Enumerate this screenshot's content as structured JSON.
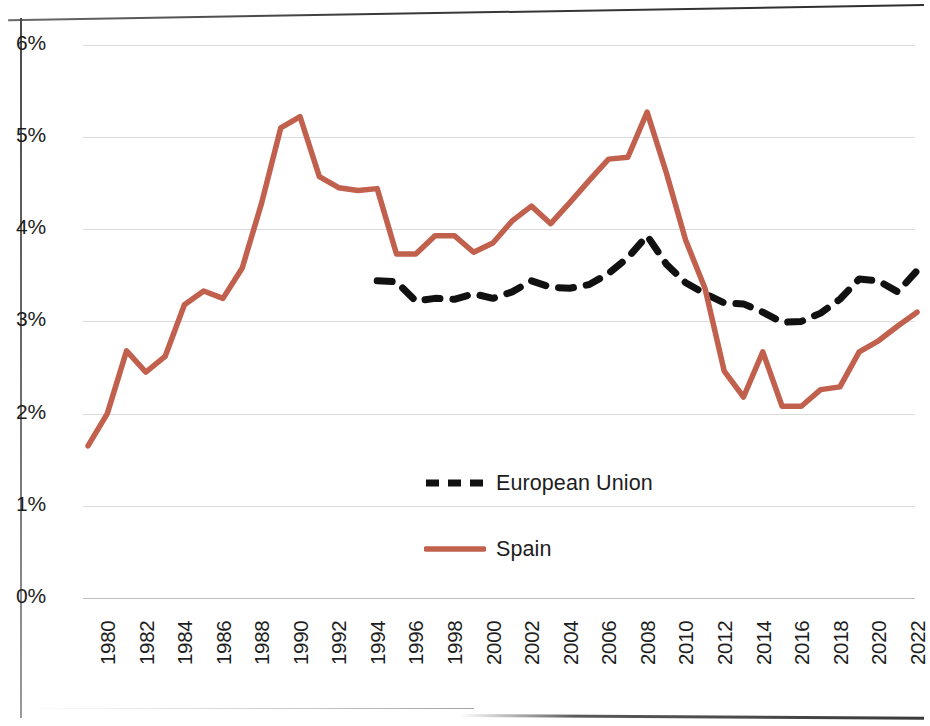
{
  "chart_data": {
    "type": "line",
    "title": "",
    "subtitle": "",
    "xlabel": "",
    "ylabel": "",
    "xlim": [
      1980,
      2023
    ],
    "ylim": [
      0,
      6
    ],
    "y_ticks": [
      0,
      1,
      2,
      3,
      4,
      5,
      6
    ],
    "y_tick_labels": [
      "0%",
      "1%",
      "2%",
      "3%",
      "4%",
      "5%",
      "6%"
    ],
    "x_tick_labels": [
      "1980",
      "1982",
      "1984",
      "1986",
      "1988",
      "1990",
      "1992",
      "1994",
      "1996",
      "1998",
      "2000",
      "2002",
      "2004",
      "2006",
      "2008",
      "2010",
      "2012",
      "2014",
      "2016",
      "2018",
      "2020",
      "2022"
    ],
    "x_tick_values": [
      1980,
      1982,
      1984,
      1986,
      1988,
      1990,
      1992,
      1994,
      1996,
      1998,
      2000,
      2002,
      2004,
      2006,
      2008,
      2010,
      2012,
      2014,
      2016,
      2018,
      2020,
      2022
    ],
    "grid": "horizontal",
    "legend_position": "center",
    "series": [
      {
        "name": "European Union",
        "color": "#111111",
        "style": "dashed",
        "x": [
          1995,
          1996,
          1997,
          1998,
          1999,
          2000,
          2001,
          2002,
          2003,
          2004,
          2005,
          2006,
          2007,
          2008,
          2009,
          2010,
          2011,
          2012,
          2013,
          2014,
          2015,
          2016,
          2017,
          2018,
          2019,
          2020,
          2021,
          2022,
          2023
        ],
        "values": [
          3.44,
          3.43,
          3.22,
          3.25,
          3.24,
          3.3,
          3.25,
          3.32,
          3.44,
          3.37,
          3.36,
          3.4,
          3.52,
          3.69,
          3.93,
          3.62,
          3.42,
          3.3,
          3.2,
          3.19,
          3.1,
          2.99,
          3.0,
          3.09,
          3.24,
          3.46,
          3.44,
          3.32,
          3.55
        ]
      },
      {
        "name": "Spain",
        "color": "#c0604d",
        "style": "solid",
        "x": [
          1980,
          1981,
          1982,
          1983,
          1984,
          1985,
          1986,
          1987,
          1988,
          1989,
          1990,
          1991,
          1992,
          1993,
          1994,
          1995,
          1996,
          1997,
          1998,
          1999,
          2000,
          2001,
          2002,
          2003,
          2004,
          2005,
          2006,
          2007,
          2008,
          2009,
          2010,
          2011,
          2012,
          2013,
          2014,
          2015,
          2016,
          2017,
          2018,
          2019,
          2020,
          2021,
          2022,
          2023
        ],
        "values": [
          1.65,
          2.0,
          2.68,
          2.45,
          2.62,
          3.18,
          3.33,
          3.25,
          3.58,
          4.28,
          5.1,
          5.22,
          4.57,
          4.45,
          4.42,
          4.44,
          3.73,
          3.73,
          3.93,
          3.93,
          3.75,
          3.85,
          4.09,
          4.25,
          4.06,
          4.29,
          4.53,
          4.76,
          4.78,
          5.27,
          4.61,
          3.88,
          3.36,
          2.46,
          2.18,
          2.67,
          2.08,
          2.08,
          2.26,
          2.29,
          2.67,
          2.79,
          2.95,
          3.1
        ]
      }
    ]
  },
  "axis": {
    "y_labels": [
      "6%",
      "5%",
      "4%",
      "3%",
      "2%",
      "1%",
      "0%"
    ],
    "x_labels": [
      "1980",
      "1982",
      "1984",
      "1986",
      "1988",
      "1990",
      "1992",
      "1994",
      "1996",
      "1998",
      "2000",
      "2002",
      "2004",
      "2006",
      "2008",
      "2010",
      "2012",
      "2014",
      "2016",
      "2018",
      "2020",
      "2022"
    ]
  },
  "legend": {
    "items": [
      {
        "label": "European Union",
        "color": "#111111",
        "style": "dashed"
      },
      {
        "label": "Spain",
        "color": "#c0604d",
        "style": "solid"
      }
    ]
  }
}
